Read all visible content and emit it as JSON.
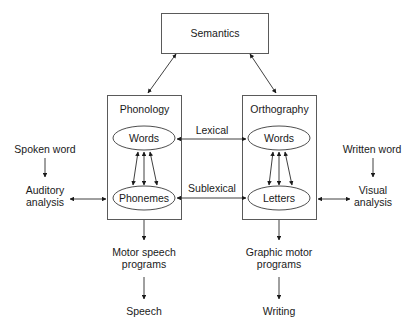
{
  "diagram": {
    "semantics": {
      "label": "Semantics"
    },
    "phonology": {
      "title": "Phonology",
      "words": "Words",
      "phonemes": "Phonemes"
    },
    "orthography": {
      "title": "Orthography",
      "words": "Words",
      "letters": "Letters"
    },
    "routes": {
      "lexical": "Lexical",
      "sublexical": "Sublexical"
    },
    "left_input": {
      "source": "Spoken word",
      "analysis_line1": "Auditory",
      "analysis_line2": "analysis"
    },
    "right_input": {
      "source": "Written word",
      "analysis_line1": "Visual",
      "analysis_line2": "analysis"
    },
    "left_output": {
      "programs_line1": "Motor speech",
      "programs_line2": "programs",
      "result": "Speech"
    },
    "right_output": {
      "programs_line1": "Graphic motor",
      "programs_line2": "programs",
      "result": "Writing"
    }
  }
}
